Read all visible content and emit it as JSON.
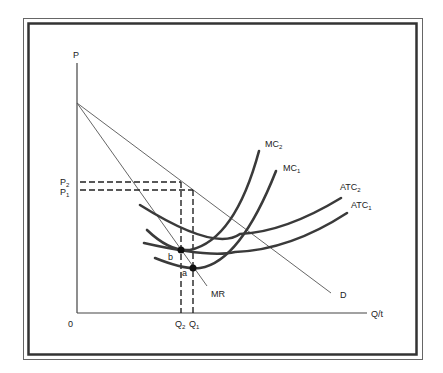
{
  "diagram": {
    "type": "monopoly cost-shift diagram",
    "axes": {
      "y_label": "P",
      "x_label": "Q/t",
      "origin_label": "0"
    },
    "price_levels": [
      {
        "label": "P",
        "subscript": "2"
      },
      {
        "label": "P",
        "subscript": "1"
      }
    ],
    "quantity_levels": [
      {
        "label": "Q",
        "subscript": "2"
      },
      {
        "label": "Q",
        "subscript": "1"
      }
    ],
    "curves": {
      "mc2": {
        "label": "MC",
        "subscript": "2"
      },
      "mc1": {
        "label": "MC",
        "subscript": "1"
      },
      "atc2": {
        "label": "ATC",
        "subscript": "2"
      },
      "atc1": {
        "label": "ATC",
        "subscript": "1"
      },
      "mr": {
        "label": "MR"
      },
      "demand": {
        "label": "D"
      }
    },
    "points": {
      "b": {
        "label": "b"
      },
      "a": {
        "label": "a"
      }
    },
    "colors": {
      "curve": "#3a3a3a",
      "line": "#555555",
      "frame": "#444444",
      "text": "#222222"
    }
  }
}
